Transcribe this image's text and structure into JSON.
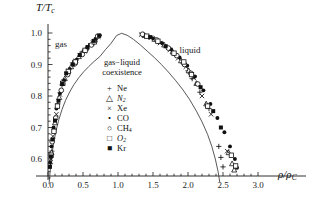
{
  "chart_data": {
    "type": "scatter",
    "title": "",
    "xlabel": "rho/rho_C",
    "ylabel": "T/T_c",
    "xlim": [
      -0.08,
      3.05
    ],
    "ylim": [
      0.52,
      1.035
    ],
    "xticks": [
      0.0,
      0.5,
      1.0,
      1.5,
      2.0,
      2.5,
      3.0
    ],
    "xticklabels": [
      "0.0",
      "0.5",
      "1.0",
      "1.5",
      "2.0",
      "2.5",
      "3.0"
    ],
    "yticks": [
      0.6,
      0.7,
      0.8,
      0.9,
      1.0
    ],
    "yticklabels": [
      "0.6",
      "0.7",
      "0.8",
      "0.9",
      "1.0"
    ],
    "minor_tick_step_x": 0.1,
    "minor_tick_step_y": 0.02,
    "grid": false,
    "legend_position": "center",
    "annotations": [
      {
        "text": "gas",
        "x": 0.13,
        "y": 0.965
      },
      {
        "text": "liquid",
        "x": 1.93,
        "y": 0.945
      },
      {
        "text": "gas−liquid",
        "x": 1.05,
        "y": 0.905
      },
      {
        "text": "coexistence",
        "x": 1.05,
        "y": 0.875
      }
    ],
    "series": [
      {
        "name": "Ne",
        "marker": "plus",
        "fill": "none",
        "points": [
          [
            0.035,
            0.585
          ],
          [
            0.055,
            0.625
          ],
          [
            0.09,
            0.695
          ],
          [
            0.14,
            0.775
          ],
          [
            0.2,
            0.835
          ],
          [
            0.27,
            0.875
          ],
          [
            0.35,
            0.905
          ],
          [
            0.46,
            0.935
          ],
          [
            0.58,
            0.96
          ],
          [
            0.7,
            0.985
          ],
          [
            1.44,
            0.988
          ],
          [
            1.58,
            0.972
          ],
          [
            1.7,
            0.955
          ],
          [
            1.82,
            0.93
          ],
          [
            1.92,
            0.905
          ],
          [
            2.0,
            0.88
          ],
          [
            2.06,
            0.855
          ],
          [
            2.17,
            0.812
          ],
          [
            2.3,
            0.76
          ],
          [
            2.44,
            0.64
          ],
          [
            2.47,
            0.605
          ],
          [
            2.5,
            0.575
          ]
        ]
      },
      {
        "name": "N2",
        "marker": "triangle",
        "fill": "none",
        "points": [
          [
            0.05,
            0.62
          ],
          [
            0.1,
            0.715
          ],
          [
            0.16,
            0.795
          ],
          [
            0.24,
            0.855
          ],
          [
            0.33,
            0.893
          ],
          [
            0.44,
            0.925
          ],
          [
            0.55,
            0.952
          ],
          [
            0.67,
            0.978
          ],
          [
            1.38,
            0.992
          ],
          [
            1.52,
            0.98
          ],
          [
            1.66,
            0.962
          ],
          [
            1.78,
            0.94
          ],
          [
            1.9,
            0.912
          ],
          [
            2.01,
            0.88
          ],
          [
            2.12,
            0.84
          ],
          [
            2.26,
            0.775
          ],
          [
            2.58,
            0.62
          ],
          [
            2.63,
            0.585
          ],
          [
            2.66,
            0.565
          ]
        ]
      },
      {
        "name": "Xe",
        "marker": "cross",
        "fill": "none",
        "points": [
          [
            0.04,
            0.6
          ],
          [
            0.07,
            0.672
          ],
          [
            0.12,
            0.742
          ],
          [
            0.17,
            0.805
          ],
          [
            0.22,
            0.845
          ],
          [
            0.3,
            0.88
          ],
          [
            0.4,
            0.912
          ],
          [
            0.52,
            0.942
          ],
          [
            0.64,
            0.968
          ],
          [
            0.72,
            0.988
          ],
          [
            1.33,
            0.995
          ],
          [
            1.47,
            0.985
          ],
          [
            1.6,
            0.968
          ],
          [
            1.74,
            0.946
          ],
          [
            1.86,
            0.92
          ],
          [
            1.97,
            0.893
          ],
          [
            2.08,
            0.858
          ],
          [
            2.2,
            0.8
          ],
          [
            2.33,
            0.742
          ],
          [
            2.56,
            0.625
          ]
        ]
      },
      {
        "name": "CO",
        "marker": "dot",
        "fill": "solid",
        "points": [
          [
            0.03,
            0.59
          ],
          [
            0.05,
            0.64
          ],
          [
            0.08,
            0.7
          ],
          [
            0.12,
            0.76
          ],
          [
            0.17,
            0.808
          ],
          [
            0.23,
            0.85
          ],
          [
            0.31,
            0.886
          ],
          [
            0.41,
            0.915
          ],
          [
            0.5,
            0.94
          ],
          [
            0.6,
            0.962
          ],
          [
            0.68,
            0.98
          ],
          [
            0.74,
            0.993
          ],
          [
            1.36,
            0.994
          ],
          [
            1.5,
            0.983
          ],
          [
            1.63,
            0.968
          ],
          [
            1.76,
            0.948
          ],
          [
            1.88,
            0.922
          ],
          [
            1.99,
            0.896
          ],
          [
            2.1,
            0.862
          ],
          [
            2.22,
            0.818
          ],
          [
            2.32,
            0.775
          ],
          [
            2.42,
            0.73
          ],
          [
            2.52,
            0.685
          ],
          [
            2.6,
            0.64
          ],
          [
            2.67,
            0.6
          ],
          [
            2.7,
            0.572
          ]
        ]
      },
      {
        "name": "CH4",
        "marker": "circle",
        "fill": "none",
        "points": [
          [
            0.06,
            0.655
          ],
          [
            0.11,
            0.73
          ],
          [
            0.19,
            0.818
          ],
          [
            0.28,
            0.868
          ],
          [
            0.38,
            0.902
          ],
          [
            0.49,
            0.932
          ],
          [
            0.62,
            0.962
          ],
          [
            0.71,
            0.99
          ],
          [
            1.35,
            0.996
          ],
          [
            1.55,
            0.978
          ],
          [
            1.72,
            0.952
          ],
          [
            1.84,
            0.928
          ],
          [
            1.95,
            0.9
          ],
          [
            2.04,
            0.872
          ],
          [
            2.14,
            0.838
          ]
        ]
      },
      {
        "name": "O2",
        "marker": "square",
        "fill": "none",
        "points": [
          [
            0.045,
            0.612
          ],
          [
            0.085,
            0.688
          ],
          [
            0.135,
            0.768
          ],
          [
            0.21,
            0.84
          ],
          [
            0.29,
            0.878
          ],
          [
            0.39,
            0.908
          ],
          [
            0.53,
            0.945
          ],
          [
            0.66,
            0.972
          ],
          [
            1.41,
            0.99
          ],
          [
            1.57,
            0.974
          ],
          [
            1.8,
            0.936
          ],
          [
            1.94,
            0.908
          ],
          [
            2.05,
            0.868
          ],
          [
            2.28,
            0.768
          ],
          [
            2.62,
            0.612
          ],
          [
            2.68,
            0.578
          ]
        ]
      },
      {
        "name": "Kr",
        "marker": "fsquare",
        "fill": "solid",
        "points": [
          [
            0.028,
            0.575
          ],
          [
            0.042,
            0.608
          ],
          [
            0.065,
            0.662
          ],
          [
            0.1,
            0.722
          ],
          [
            0.15,
            0.785
          ],
          [
            0.205,
            0.838
          ],
          [
            0.26,
            0.872
          ],
          [
            0.355,
            0.9
          ],
          [
            0.455,
            0.93
          ],
          [
            0.565,
            0.955
          ],
          [
            0.655,
            0.975
          ],
          [
            0.73,
            0.991
          ],
          [
            1.46,
            0.987
          ],
          [
            1.68,
            0.958
          ],
          [
            2.18,
            0.828
          ],
          [
            2.36,
            0.752
          ],
          [
            2.47,
            0.7
          ]
        ]
      }
    ],
    "curve": {
      "label": "coexistence-curve",
      "description": "Mean-field / van der Waals style coexistence dome peaking at rho/rho_C = 1.0, T/T_c = 1.0",
      "points": [
        [
          0.015,
          0.52
        ],
        [
          0.03,
          0.56
        ],
        [
          0.05,
          0.605
        ],
        [
          0.08,
          0.65
        ],
        [
          0.115,
          0.69
        ],
        [
          0.155,
          0.725
        ],
        [
          0.2,
          0.757
        ],
        [
          0.25,
          0.786
        ],
        [
          0.31,
          0.813
        ],
        [
          0.37,
          0.836
        ],
        [
          0.44,
          0.858
        ],
        [
          0.51,
          0.877
        ],
        [
          0.58,
          0.893
        ],
        [
          0.66,
          0.91
        ],
        [
          0.74,
          0.925
        ],
        [
          0.82,
          0.947
        ],
        [
          0.9,
          0.967
        ],
        [
          0.98,
          0.992
        ],
        [
          1.05,
          0.999
        ],
        [
          1.13,
          0.993
        ],
        [
          1.22,
          0.98
        ],
        [
          1.32,
          0.962
        ],
        [
          1.42,
          0.942
        ],
        [
          1.52,
          0.922
        ],
        [
          1.62,
          0.9
        ],
        [
          1.72,
          0.876
        ],
        [
          1.82,
          0.85
        ],
        [
          1.92,
          0.822
        ],
        [
          2.02,
          0.79
        ],
        [
          2.12,
          0.752
        ],
        [
          2.2,
          0.718
        ],
        [
          2.28,
          0.678
        ],
        [
          2.34,
          0.64
        ],
        [
          2.39,
          0.6
        ],
        [
          2.43,
          0.56
        ],
        [
          2.455,
          0.525
        ]
      ]
    },
    "legend_entries": [
      {
        "glyph": "+",
        "label": "Ne",
        "italic": false
      },
      {
        "glyph": "△",
        "label": "N",
        "sub": "2",
        "italic": true
      },
      {
        "glyph": "×",
        "label": "Xe",
        "italic": false
      },
      {
        "glyph": "•",
        "label": "CO",
        "italic": false
      },
      {
        "glyph": "○",
        "label": "CH",
        "sub": "4",
        "italic": false
      },
      {
        "glyph": "□",
        "label": "O",
        "sub": "2",
        "italic": true
      },
      {
        "glyph": "■",
        "label": "Kr",
        "italic": false
      }
    ]
  },
  "labels": {
    "y_axis": "T/T",
    "y_axis_sub": "c",
    "x_axis": "ρ/ρ",
    "x_axis_sub": "C",
    "gas": "gas",
    "liquid": "liquid",
    "coex_line1": "gas−liquid",
    "coex_line2": "coexistence"
  },
  "colors": {
    "axis": "#1a1a1a",
    "curve": "#3a3a3a",
    "marker": "#111111",
    "background": "#ffffff"
  }
}
